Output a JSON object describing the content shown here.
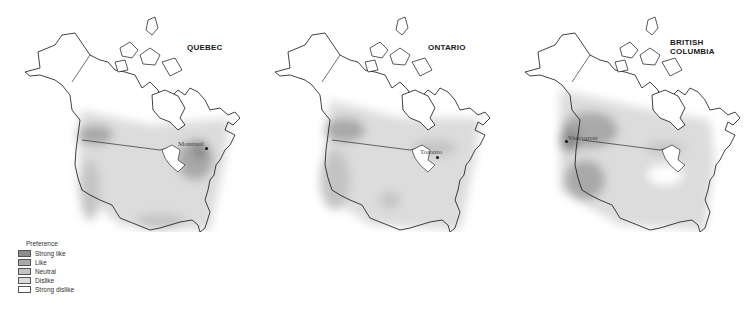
{
  "maps": [
    {
      "title": "QUEBEC",
      "city": "Montreal"
    },
    {
      "title": "ONTARIO",
      "city": "Toronto"
    },
    {
      "title": "BRITISH\nCOLUMBIA",
      "city": "Vancouver"
    }
  ],
  "legend": {
    "title": "Preference",
    "items": [
      {
        "label": "Strong like",
        "color": "#8c8c8c"
      },
      {
        "label": "Like",
        "color": "#a9a9a9"
      },
      {
        "label": "Neutral",
        "color": "#c4c4c4"
      },
      {
        "label": "Dislike",
        "color": "#dcdcdc"
      },
      {
        "label": "Strong dislike",
        "color": "#ffffff"
      }
    ]
  }
}
